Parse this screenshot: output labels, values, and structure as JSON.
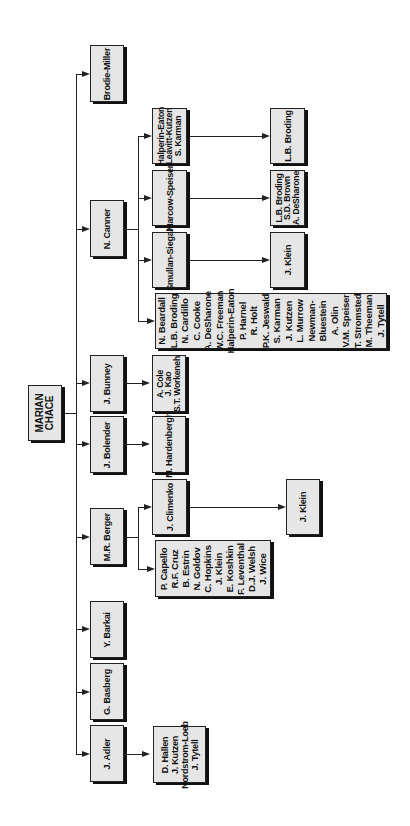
{
  "root": {
    "label": "MARIAN\nCHACE"
  },
  "level1": [
    {
      "id": "brodie-miller",
      "label": "Brodie-Miller"
    },
    {
      "id": "canner",
      "label": "N. Canner"
    },
    {
      "id": "bunney",
      "label": "J. Bunney"
    },
    {
      "id": "bolender",
      "label": "J. Bolender"
    },
    {
      "id": "berger",
      "label": "M.R. Berger"
    },
    {
      "id": "barkai",
      "label": "Y. Barkai"
    },
    {
      "id": "basberg",
      "label": "G. Basberg"
    },
    {
      "id": "adler",
      "label": "J. Adler"
    }
  ],
  "canner_children": {
    "halperin": "Halperin-Eaton\nLeavitt-Kutzen\nS. Karman",
    "marcow": "Marcow-Speiser",
    "smullan": "Smullan-Siegal",
    "list": "N. Beardall\nL.B. Broding\nN. Cardillo\nC. Cooke\nA. DeSharone\nW.C. Freeman\nHalperin-Eaton\nP. Harnel\nR. Holt\nP.K. Jeswald\nS. Karman\nJ. Kutzen\nL. Murrow\nNewman-\nBluestein\nA. Olin\nV.M. Speiser\nT. Stromsted\nM. Theeman\nJ. Tytell"
  },
  "canner_grandchildren": {
    "halperin": "L.B. Broding",
    "marcow": "L.B. Broding\nS.D. Brown\nA. DeSharone",
    "smullan": "J. Klein"
  },
  "bunney_children": {
    "list": "A. Cole\nJ. Kao\nS.T. Workeneh"
  },
  "bolender_children": {
    "list": "M. Hardenbergh"
  },
  "berger_children": {
    "climenko": "J. Climenko",
    "list": "P. Capello\nR.F. Cruz\nB. Estrin\nN. Goldov\nC. Hopkins\nJ. Klein\nE. Koshkin\nF. Leventhal\nD.J. Welsh\nJ. Wice"
  },
  "berger_grandchildren": {
    "climenko": "J. Klein"
  },
  "adler_children": {
    "list": "D. Hallen\nJ. Kutzen\nNordstrom-Loeb\nJ. Tytell"
  }
}
